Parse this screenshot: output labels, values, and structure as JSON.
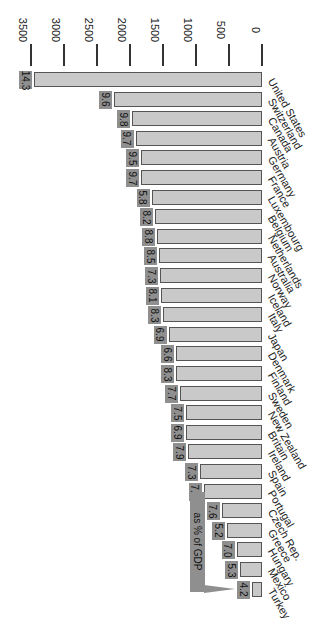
{
  "chart_data": {
    "type": "bar",
    "orientation": "rotated-90-clockwise",
    "title": "",
    "annotation": "as % of GDP",
    "xlabel": "",
    "ylabel": "",
    "ylim": [
      0,
      3500
    ],
    "yticks": [
      0,
      500,
      1000,
      1500,
      2000,
      2500,
      3000,
      3500
    ],
    "categories": [
      "United States",
      "Switzerland",
      "Canada",
      "Austria",
      "Germany",
      "France",
      "Luxembourg",
      "Belgium",
      "Netherlands",
      "Australia",
      "Norway",
      "Iceland",
      "Italy",
      "Japan",
      "Denmark",
      "Finland",
      "Sweden",
      "New Zealand",
      "Britain",
      "Ireland",
      "Spain",
      "Portugal",
      "Czech Rep.",
      "Greece",
      "Hungary",
      "Mexico",
      "Turkey"
    ],
    "series": [
      {
        "name": "Spending",
        "values": [
          3450,
          2240,
          1970,
          1910,
          1830,
          1830,
          1670,
          1620,
          1590,
          1560,
          1545,
          1530,
          1500,
          1410,
          1300,
          1300,
          1240,
          1150,
          1150,
          1120,
          940,
          880,
          610,
          530,
          380,
          330,
          150
        ]
      },
      {
        "name": "as % of GDP",
        "values": [
          14.3,
          9.6,
          9.8,
          9.7,
          9.5,
          9.7,
          5.8,
          8.2,
          8.8,
          8.5,
          7.3,
          8.1,
          8.3,
          6.9,
          6.6,
          8.3,
          7.7,
          7.5,
          6.9,
          7.9,
          7.3,
          7.6,
          7.6,
          5.2,
          7.0,
          5.3,
          4.2
        ]
      }
    ],
    "grid": false,
    "legend": "none"
  },
  "layout": {
    "zero_x": 262,
    "px_per_unit": 0.066,
    "first_bar_top": 72,
    "bar_pitch": 19.6,
    "bar_thickness": 15
  },
  "colors": {
    "bar_fill": "#c9c9c9",
    "bar_border": "#555555",
    "badge": "#8f8f8f"
  }
}
